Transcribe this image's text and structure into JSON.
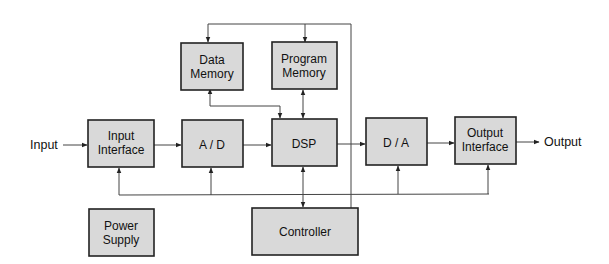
{
  "diagram": {
    "blocks": {
      "data_memory": {
        "line1": "Data",
        "line2": "Memory"
      },
      "program_memory": {
        "line1": "Program",
        "line2": "Memory"
      },
      "input_interface": {
        "line1": "Input",
        "line2": "Interface"
      },
      "ad": {
        "label": "A / D"
      },
      "dsp": {
        "label": "DSP"
      },
      "da": {
        "label": "D / A"
      },
      "output_interface": {
        "line1": "Output",
        "line2": "Interface"
      },
      "power_supply": {
        "line1": "Power",
        "line2": "Supply"
      },
      "controller": {
        "label": "Controller"
      }
    },
    "external": {
      "input": "Input",
      "output": "Output"
    },
    "colors": {
      "box_fill": "#d9d9d9",
      "box_stroke": "#222222",
      "line": "#444444"
    }
  }
}
